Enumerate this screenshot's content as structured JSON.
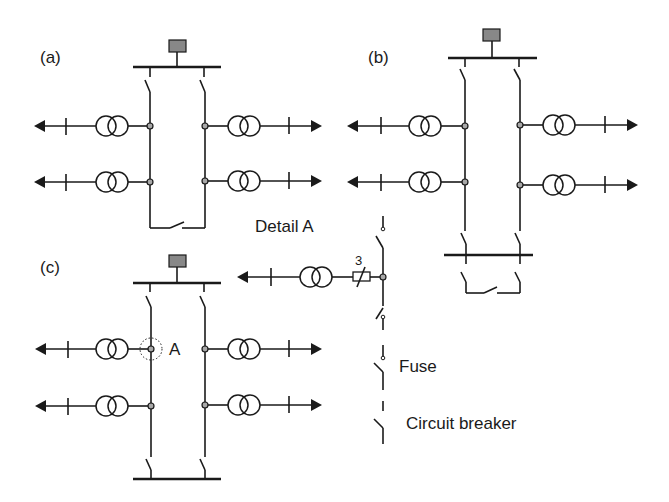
{
  "diagram": {
    "type": "single-line electrical diagram",
    "panels": {
      "a": {
        "label": "(a)",
        "description": "Single busbar with two feeder sections joined by a normally-open tie switch"
      },
      "b": {
        "label": "(b)",
        "description": "Two feeder sections with a second busbar and a tie switch"
      },
      "c": {
        "label": "(c)",
        "description": "Two feeder sections between two busbars, with point A marked"
      }
    },
    "detail": {
      "title": "Detail A",
      "count_label": "3",
      "point_label": "A"
    },
    "legend": {
      "fuse": "Fuse",
      "circuit_breaker": "Circuit breaker"
    },
    "colors": {
      "line": "#1a1a1a",
      "node_fill": "#a8a8a8",
      "source_fill": "#888888",
      "background": "#ffffff"
    }
  }
}
